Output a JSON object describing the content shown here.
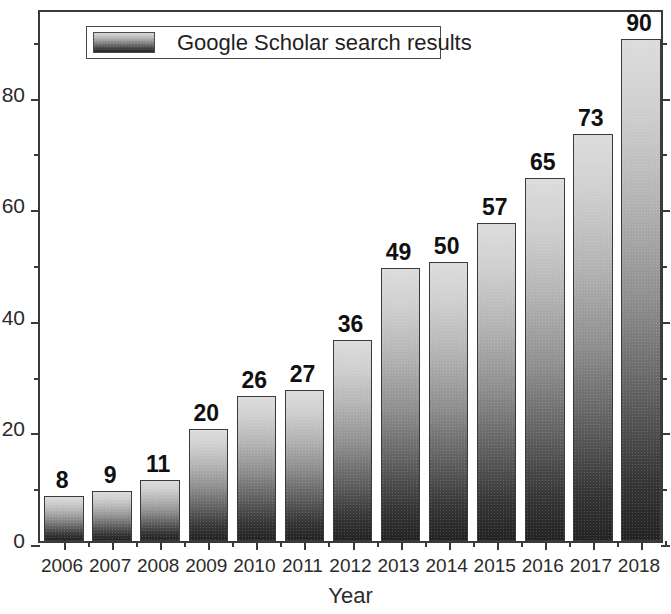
{
  "chart_data": {
    "type": "bar",
    "title": "",
    "xlabel": "Year",
    "ylabel": "",
    "categories": [
      "2006",
      "2007",
      "2008",
      "2009",
      "2010",
      "2011",
      "2012",
      "2013",
      "2014",
      "2015",
      "2016",
      "2017",
      "2018"
    ],
    "values": [
      8,
      9,
      11,
      20,
      26,
      27,
      36,
      49,
      50,
      57,
      65,
      73,
      90
    ],
    "value_labels": [
      "8",
      "9",
      "11",
      "20",
      "26",
      "27",
      "36",
      "49",
      "50",
      "57",
      "65",
      "73",
      "90"
    ],
    "series": [
      {
        "name": "Google Scholar search results",
        "values": [
          8,
          9,
          11,
          20,
          26,
          27,
          36,
          49,
          50,
          57,
          65,
          73,
          90
        ]
      }
    ],
    "ylim": [
      0,
      95.5
    ],
    "y_major_ticks": [
      0,
      20,
      40,
      60,
      80
    ],
    "y_major_tick_labels": [
      "0",
      "20",
      "40",
      "60",
      "80"
    ],
    "y_minor_ticks": [
      10,
      30,
      50,
      70,
      90
    ],
    "grid": false,
    "legend": {
      "position": "top-left",
      "entries": [
        "Google Scholar search results"
      ]
    },
    "bar_style": {
      "gradient_top": "#dcdcdc",
      "gradient_bottom": "#232323",
      "edge_color": "#3b3b3b"
    },
    "axis_color": "#3a3a3a",
    "background": "#ffffff"
  },
  "legend": {
    "label": "Google Scholar search results"
  },
  "axes": {
    "x_title": "Year"
  }
}
